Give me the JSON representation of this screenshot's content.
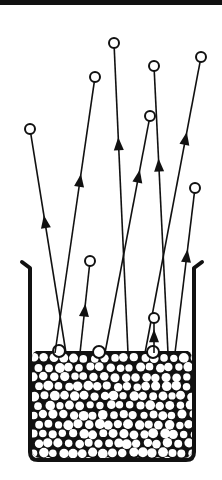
{
  "diagram": {
    "title": "",
    "colors": {
      "ink": "#111111",
      "background": "#ffffff"
    },
    "container": {
      "left": 30,
      "right": 194,
      "top": 262,
      "bottom": 460,
      "rim_flare": 8,
      "bed_top": 353
    },
    "trajectories": [
      {
        "id": "t1",
        "start": [
          66,
          353
        ],
        "end": [
          30,
          129
        ],
        "arrow_at": 0.58
      },
      {
        "id": "t2",
        "start": [
          55,
          353
        ],
        "end": [
          95,
          77
        ],
        "arrow_at": 0.62
      },
      {
        "id": "t3",
        "start": [
          128,
          353
        ],
        "end": [
          114,
          43
        ],
        "arrow_at": 0.67
      },
      {
        "id": "t4",
        "start": [
          168,
          353
        ],
        "end": [
          154,
          66
        ],
        "arrow_at": 0.65
      },
      {
        "id": "t5",
        "start": [
          105,
          353
        ],
        "end": [
          150,
          116
        ],
        "arrow_at": 0.74
      },
      {
        "id": "t6",
        "start": [
          145,
          353
        ],
        "end": [
          201,
          57
        ],
        "arrow_at": 0.72
      },
      {
        "id": "t7",
        "start": [
          80,
          353
        ],
        "end": [
          90,
          261
        ],
        "arrow_at": 0.45
      },
      {
        "id": "t8",
        "start": [
          175,
          353
        ],
        "end": [
          195,
          188
        ],
        "arrow_at": 0.58
      },
      {
        "id": "t9",
        "start": [
          154,
          353
        ],
        "end": [
          154,
          318
        ],
        "arrow_at": 0.45
      }
    ],
    "particle_radius": 5
  }
}
